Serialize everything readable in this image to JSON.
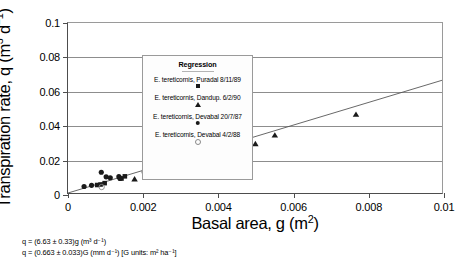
{
  "chart_data": {
    "type": "scatter",
    "title": "",
    "xlabel": "Basal area, g (m2)",
    "ylabel": "Transpiration rate, q (m3 d-1)",
    "xlim": [
      0,
      0.01
    ],
    "ylim": [
      0,
      0.1
    ],
    "xticks": [
      "0",
      "0.002",
      "0.004",
      "0.006",
      "0.008",
      "0.01"
    ],
    "xtick_values": [
      0,
      0.002,
      0.004,
      0.006,
      0.008,
      0.01
    ],
    "yticks": [
      "0",
      "0.02",
      "0.04",
      "0.06",
      "0.08",
      "0.1"
    ],
    "ytick_values": [
      0,
      0.02,
      0.04,
      0.06,
      0.08,
      0.1
    ],
    "grid": "horizontal",
    "legend_position": "top-left-inside",
    "series": [
      {
        "name": "E. tereticornis, Puradal 8/11/89",
        "marker": "filled-square",
        "points": [
          {
            "x": 0.00078,
            "y": 0.0047
          },
          {
            "x": 0.00087,
            "y": 0.005
          },
          {
            "x": 0.00098,
            "y": 0.0058
          },
          {
            "x": 0.00143,
            "y": 0.0085
          },
          {
            "x": 0.00152,
            "y": 0.0098
          },
          {
            "x": 0.00204,
            "y": 0.0128
          },
          {
            "x": 0.00214,
            "y": 0.013
          },
          {
            "x": 0.00342,
            "y": 0.025
          }
        ]
      },
      {
        "name": "E. tereticornis, Dandup. 6/2/90",
        "marker": "filled-triangle",
        "points": [
          {
            "x": 0.00178,
            "y": 0.0082
          },
          {
            "x": 0.00219,
            "y": 0.0157
          },
          {
            "x": 0.00281,
            "y": 0.025
          },
          {
            "x": 0.0038,
            "y": 0.027
          },
          {
            "x": 0.0045,
            "y": 0.0487
          },
          {
            "x": 0.00501,
            "y": 0.0289
          },
          {
            "x": 0.00553,
            "y": 0.034
          },
          {
            "x": 0.0077,
            "y": 0.0462
          }
        ]
      },
      {
        "name": "E. tereticornis, Devabal 20/7/87",
        "marker": "filled-circle",
        "points": [
          {
            "x": 0.00043,
            "y": 0.0038
          },
          {
            "x": 0.00063,
            "y": 0.0045
          },
          {
            "x": 0.00089,
            "y": 0.0122
          },
          {
            "x": 0.00102,
            "y": 0.0095
          },
          {
            "x": 0.00113,
            "y": 0.009
          },
          {
            "x": 0.00136,
            "y": 0.0096
          },
          {
            "x": 0.00139,
            "y": 0.0086
          },
          {
            "x": 0.00212,
            "y": 0.0195
          }
        ]
      },
      {
        "name": "E. tereticornis, Devabal 4/2/88",
        "marker": "open-circle",
        "points": [
          {
            "x": 0.0009,
            "y": 0.0035
          },
          {
            "x": 0.00204,
            "y": 0.0125
          },
          {
            "x": 0.00222,
            "y": 0.0118
          },
          {
            "x": 0.00408,
            "y": 0.025
          }
        ]
      }
    ],
    "regression_line": {
      "name": "Regression",
      "slope": 6.63,
      "intercept": 0,
      "x_start": 0,
      "y_start": 0,
      "x_end": 0.0105,
      "y_end": 0.0696
    },
    "annotations": [
      "q = (6.63 ± 0.33)g    (m³ d⁻¹)",
      "q = (0.663 ± 0.033)G (mm d⁻¹) [G units: m² ha⁻¹]"
    ]
  },
  "axes": {
    "y_title_main": "Transpiration rate, q (m",
    "y_title_sup1": "3",
    "y_title_mid": " d",
    "y_title_sup2": "−1",
    "y_title_end": ")",
    "x_title_main": "Basal area, g (m",
    "x_title_sup": "2",
    "x_title_end": ")"
  },
  "legend": {
    "title": "Regression",
    "entries": [
      {
        "label": "E. tereticornis, Puradal 8/11/89",
        "marker": "filled-square"
      },
      {
        "label": "E. tereticornis, Dandup. 6/2/90",
        "marker": "filled-triangle"
      },
      {
        "label": "E. tereticornis, Devabal 20/7/87",
        "marker": "filled-circle"
      },
      {
        "label": "E. tereticornis, Devabal 4/2/88",
        "marker": "open-circle"
      }
    ]
  },
  "equations": {
    "line1": "q = (6.63 ± 0.33)g    (m³ d⁻¹)",
    "line2": "q = (0.663 ± 0.033)G (mm d⁻¹) [G units: m² ha⁻¹]"
  },
  "colors": {
    "marker": "#1a1a1a",
    "open_marker_stroke": "#8a8a8a",
    "grid": "#8d8d8d",
    "axis": "#4d4d4d",
    "regression": "#555555",
    "background": "#ffffff"
  }
}
